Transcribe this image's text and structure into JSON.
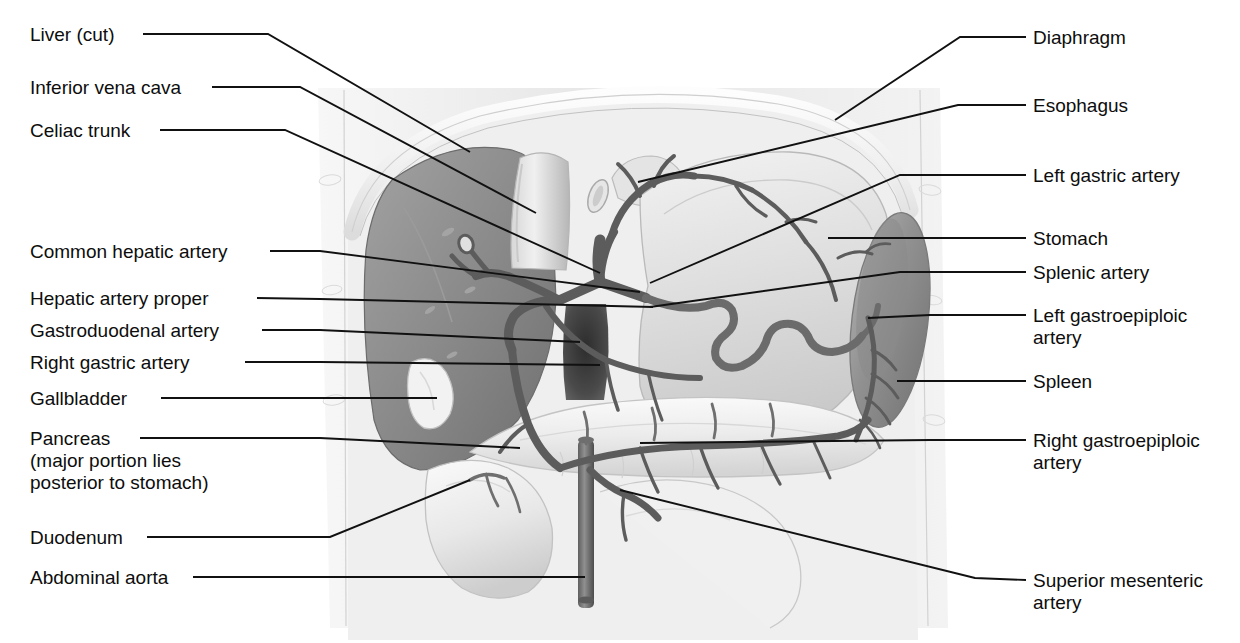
{
  "figure": {
    "view": "anterior",
    "style": "grayscale medical illustration",
    "colors": {
      "background": "#ffffff",
      "leader_line": "#111111",
      "body_wall": "#ededed",
      "liver": "#8e8e8e",
      "spleen": "#9a9a9a",
      "stomach": "#e2e2e2",
      "pancreas": "#f0f0f0",
      "artery": "#6b6b6b",
      "aorta_dark": "#4a4a4a",
      "text": "#0d0d0d"
    }
  },
  "labels": {
    "left": [
      {
        "id": "liver-cut",
        "text": "Liver (cut)",
        "x": 30,
        "y": 24,
        "line_x": 143,
        "line_y": 34,
        "elbow_x": 268,
        "elbow_y": 34,
        "tip_x": 470,
        "tip_y": 152
      },
      {
        "id": "inferior-vena-cava",
        "text": "Inferior vena cava",
        "x": 30,
        "y": 77,
        "line_x": 212,
        "line_y": 87,
        "elbow_x": 300,
        "elbow_y": 87,
        "tip_x": 536,
        "tip_y": 213
      },
      {
        "id": "celiac-trunk",
        "text": "Celiac trunk",
        "x": 30,
        "y": 120,
        "line_x": 160,
        "line_y": 130,
        "elbow_x": 285,
        "elbow_y": 130,
        "tip_x": 600,
        "tip_y": 273
      },
      {
        "id": "common-hepatic-artery",
        "text": "Common hepatic artery",
        "x": 30,
        "y": 241,
        "line_x": 270,
        "line_y": 251,
        "elbow_x": 320,
        "elbow_y": 251,
        "tip_x": 640,
        "tip_y": 292
      },
      {
        "id": "hepatic-artery-proper",
        "text": "Hepatic artery proper",
        "x": 30,
        "y": 288,
        "line_x": 257,
        "line_y": 298,
        "elbow_x": 320,
        "elbow_y": 299,
        "tip_x": 653,
        "tip_y": 307
      },
      {
        "id": "gastroduodenal-artery",
        "text": "Gastroduodenal artery",
        "x": 30,
        "y": 320,
        "line_x": 262,
        "line_y": 330,
        "elbow_x": 320,
        "elbow_y": 330,
        "tip_x": 580,
        "tip_y": 342
      },
      {
        "id": "right-gastric-artery",
        "text": "Right gastric artery",
        "x": 30,
        "y": 352,
        "line_x": 245,
        "line_y": 362,
        "elbow_x": 320,
        "elbow_y": 362,
        "tip_x": 600,
        "tip_y": 365
      },
      {
        "id": "gallbladder",
        "text": "Gallbladder",
        "x": 30,
        "y": 388,
        "line_x": 161,
        "line_y": 398,
        "elbow_x": 320,
        "elbow_y": 398,
        "tip_x": 437,
        "tip_y": 398
      },
      {
        "id": "pancreas",
        "text": "Pancreas\n(major portion lies\nposterior to stomach)",
        "x": 30,
        "y": 428,
        "line_x": 140,
        "line_y": 438,
        "elbow_x": 320,
        "elbow_y": 438,
        "tip_x": 520,
        "tip_y": 448
      },
      {
        "id": "duodenum",
        "text": "Duodenum",
        "x": 30,
        "y": 527,
        "line_x": 147,
        "line_y": 537,
        "elbow_x": 330,
        "elbow_y": 537,
        "tip_x": 470,
        "tip_y": 480
      },
      {
        "id": "abdominal-aorta",
        "text": "Abdominal aorta",
        "x": 30,
        "y": 567,
        "line_x": 193,
        "line_y": 577,
        "elbow_x": 420,
        "elbow_y": 577,
        "tip_x": 585,
        "tip_y": 577
      }
    ],
    "right": [
      {
        "id": "diaphragm",
        "text": "Diaphragm",
        "x": 1033,
        "y": 27,
        "line_x": 1026,
        "line_y": 37,
        "elbow_x": 960,
        "elbow_y": 37,
        "tip_x": 835,
        "tip_y": 120
      },
      {
        "id": "esophagus",
        "text": "Esophagus",
        "x": 1033,
        "y": 95,
        "line_x": 1026,
        "line_y": 105,
        "elbow_x": 958,
        "elbow_y": 105,
        "tip_x": 638,
        "tip_y": 182
      },
      {
        "id": "left-gastric-artery",
        "text": "Left gastric artery",
        "x": 1033,
        "y": 165,
        "line_x": 1026,
        "line_y": 175,
        "elbow_x": 900,
        "elbow_y": 175,
        "tip_x": 650,
        "tip_y": 283
      },
      {
        "id": "stomach",
        "text": "Stomach",
        "x": 1033,
        "y": 228,
        "line_x": 1026,
        "line_y": 238,
        "elbow_x": 900,
        "elbow_y": 238,
        "tip_x": 828,
        "tip_y": 238
      },
      {
        "id": "splenic-artery",
        "text": "Splenic artery",
        "x": 1033,
        "y": 262,
        "line_x": 1026,
        "line_y": 272,
        "elbow_x": 900,
        "elbow_y": 272,
        "tip_x": 650,
        "tip_y": 307
      },
      {
        "id": "left-gastroepiploic-artery",
        "text": "Left gastroepiploic\nartery",
        "x": 1033,
        "y": 305,
        "line_x": 1026,
        "line_y": 315,
        "elbow_x": 930,
        "elbow_y": 315,
        "tip_x": 868,
        "tip_y": 318
      },
      {
        "id": "spleen",
        "text": "Spleen",
        "x": 1033,
        "y": 371,
        "line_x": 1026,
        "line_y": 381,
        "elbow_x": 930,
        "elbow_y": 381,
        "tip_x": 897,
        "tip_y": 381
      },
      {
        "id": "right-gastroepiploic-artery",
        "text": "Right gastroepiploic\nartery",
        "x": 1033,
        "y": 430,
        "line_x": 1026,
        "line_y": 440,
        "elbow_x": 930,
        "elbow_y": 440,
        "tip_x": 640,
        "tip_y": 443
      },
      {
        "id": "superior-mesenteric-artery",
        "text": "Superior mesenteric\nartery",
        "x": 1033,
        "y": 570,
        "line_x": 1026,
        "line_y": 580,
        "elbow_x": 975,
        "elbow_y": 578,
        "tip_x": 620,
        "tip_y": 490
      }
    ]
  },
  "structures": [
    {
      "id": "body-wall",
      "name": "Abdominal body wall"
    },
    {
      "id": "diaphragm-arc",
      "name": "Diaphragm"
    },
    {
      "id": "liver-shape",
      "name": "Liver (cut)"
    },
    {
      "id": "inferior-vena-cava-shape",
      "name": "Inferior vena cava"
    },
    {
      "id": "esophagus-shape",
      "name": "Esophagus"
    },
    {
      "id": "stomach-shape",
      "name": "Stomach"
    },
    {
      "id": "spleen-shape",
      "name": "Spleen"
    },
    {
      "id": "pancreas-shape",
      "name": "Pancreas"
    },
    {
      "id": "duodenum-shape",
      "name": "Duodenum"
    },
    {
      "id": "gallbladder-shape",
      "name": "Gallbladder"
    },
    {
      "id": "aorta-shape",
      "name": "Abdominal aorta"
    },
    {
      "id": "celiac-trunk-vessel",
      "name": "Celiac trunk"
    },
    {
      "id": "common-hepatic-vessel",
      "name": "Common hepatic artery"
    },
    {
      "id": "hepatic-proper-vessel",
      "name": "Hepatic artery proper"
    },
    {
      "id": "gastroduodenal-vessel",
      "name": "Gastroduodenal artery"
    },
    {
      "id": "right-gastric-vessel",
      "name": "Right gastric artery"
    },
    {
      "id": "left-gastric-vessel",
      "name": "Left gastric artery"
    },
    {
      "id": "splenic-vessel",
      "name": "Splenic artery"
    },
    {
      "id": "left-gastroepiploic-vessel",
      "name": "Left gastroepiploic artery"
    },
    {
      "id": "right-gastroepiploic-vessel",
      "name": "Right gastroepiploic artery"
    },
    {
      "id": "superior-mesenteric-vessel",
      "name": "Superior mesenteric artery"
    }
  ]
}
